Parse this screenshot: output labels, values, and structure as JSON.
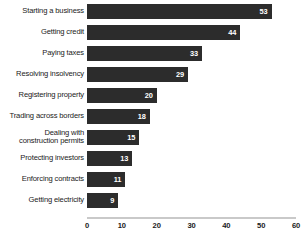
{
  "chart_data": {
    "type": "bar",
    "orientation": "horizontal",
    "title": "",
    "xlabel": "",
    "ylabel": "",
    "categories": [
      "Starting a business",
      "Getting credit",
      "Paying taxes",
      "Resolving insolvency",
      "Registering property",
      "Trading across borders",
      "Dealing with\nconstruction permits",
      "Protecting investors",
      "Enforcing contracts",
      "Getting electricity"
    ],
    "values": [
      53,
      44,
      33,
      29,
      20,
      18,
      15,
      13,
      11,
      9
    ],
    "xlim": [
      0,
      60
    ],
    "xticks": [
      0,
      10,
      20,
      30,
      40,
      50,
      60
    ],
    "xtick_labels": [
      "0",
      "10",
      "20",
      "30",
      "40",
      "50",
      "60"
    ],
    "grid": false,
    "legend": false,
    "bar_color": "#2c2c2c",
    "value_label_color": "#ffffff",
    "axis_color": "#c9c9c9",
    "background": "#ffffff"
  }
}
